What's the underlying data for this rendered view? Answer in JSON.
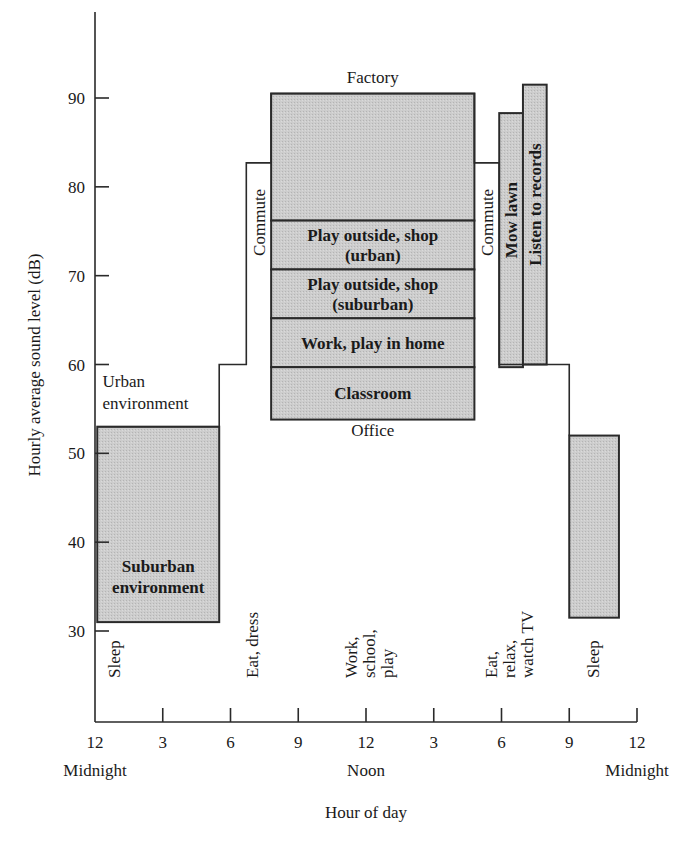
{
  "chart_data": {
    "type": "bar",
    "title": "",
    "xlabel": "Hour of day",
    "ylabel": "Hourly average sound level (dB)",
    "ylim": [
      20,
      100
    ],
    "xlim": [
      0,
      24
    ],
    "grid": false,
    "y_ticks": [
      30,
      40,
      50,
      60,
      70,
      80,
      90
    ],
    "x_ticks": [
      {
        "hour": 0,
        "label": "12",
        "sublabel": "Midnight"
      },
      {
        "hour": 3,
        "label": "3",
        "sublabel": ""
      },
      {
        "hour": 6,
        "label": "6",
        "sublabel": ""
      },
      {
        "hour": 9,
        "label": "9",
        "sublabel": ""
      },
      {
        "hour": 12,
        "label": "12",
        "sublabel": "Noon"
      },
      {
        "hour": 15,
        "label": "3",
        "sublabel": ""
      },
      {
        "hour": 18,
        "label": "6",
        "sublabel": ""
      },
      {
        "hour": 21,
        "label": "9",
        "sublabel": ""
      },
      {
        "hour": 24,
        "label": "12",
        "sublabel": "Midnight"
      }
    ],
    "urban_outline": [
      [
        0.1,
        53
      ],
      [
        5.5,
        53
      ],
      [
        5.5,
        60
      ],
      [
        6.7,
        60
      ],
      [
        6.7,
        82.7
      ],
      [
        7.8,
        82.7
      ],
      [
        7.8,
        90.5
      ],
      [
        16.8,
        90.5
      ],
      [
        16.8,
        82.7
      ],
      [
        17.9,
        82.7
      ],
      [
        17.9,
        60
      ],
      [
        21.0,
        60
      ],
      [
        21.0,
        52
      ]
    ],
    "shaded_blocks": [
      {
        "name": "Suburban environment (night)",
        "x0": 0.1,
        "x1": 5.5,
        "y0": 31,
        "y1": 53,
        "label": "Suburban\nenvironment",
        "label_bold": true
      },
      {
        "name": "Factory",
        "x0": 7.8,
        "x1": 16.8,
        "y0": 76.2,
        "y1": 90.5,
        "label": "",
        "label_bold": false
      },
      {
        "name": "Play outside, shop (urban)",
        "x0": 7.8,
        "x1": 16.8,
        "y0": 70.7,
        "y1": 76.2,
        "label": "Play outside, shop\n(urban)",
        "label_bold": true
      },
      {
        "name": "Play outside, shop (suburban)",
        "x0": 7.8,
        "x1": 16.8,
        "y0": 65.2,
        "y1": 70.7,
        "label": "Play outside, shop\n(suburban)",
        "label_bold": true
      },
      {
        "name": "Work, play in home",
        "x0": 7.8,
        "x1": 16.8,
        "y0": 59.7,
        "y1": 65.2,
        "label": "Work, play in home",
        "label_bold": true
      },
      {
        "name": "Classroom",
        "x0": 7.8,
        "x1": 16.8,
        "y0": 53.8,
        "y1": 59.7,
        "label": "Classroom",
        "label_bold": true
      },
      {
        "name": "Mow lawn",
        "x0": 17.9,
        "x1": 18.95,
        "y0": 59.7,
        "y1": 88.3,
        "label": "Mow lawn",
        "label_bold": true,
        "vertical": true
      },
      {
        "name": "Listen to records",
        "x0": 18.95,
        "x1": 20.0,
        "y0": 60,
        "y1": 91.5,
        "label": "Listen to records",
        "label_bold": true,
        "vertical": true
      },
      {
        "name": "Sleep (suburban, late night)",
        "x0": 21.0,
        "x1": 23.2,
        "y0": 31.5,
        "y1": 52,
        "label": "",
        "label_bold": false
      }
    ],
    "annotations": [
      {
        "text": "Factory",
        "hour": 12.3,
        "db": 91.7
      },
      {
        "text": "Office",
        "hour": 12.3,
        "db": 52.0
      },
      {
        "text": "Urban\nenvironment",
        "hour": 0.2,
        "db": 57.5
      },
      {
        "text": "Commute",
        "hour": 7.25,
        "db": 76,
        "vertical": true
      },
      {
        "text": "Commute",
        "hour": 17.35,
        "db": 76,
        "vertical": true
      }
    ],
    "activities": [
      {
        "text": "Sleep",
        "hour": 1.1
      },
      {
        "text": "Eat, dress",
        "hour": 7.2
      },
      {
        "text": "Work,\nschool,\nplay",
        "hour": 11.6
      },
      {
        "text": "Eat,\nrelax,\nwatch TV",
        "hour": 17.8
      },
      {
        "text": "Sleep",
        "hour": 22.3
      }
    ],
    "colors": {
      "shade": "#c9c9c9",
      "line": "#2a2a2a",
      "text": "#1a1a1a",
      "background": "#ffffff"
    }
  }
}
